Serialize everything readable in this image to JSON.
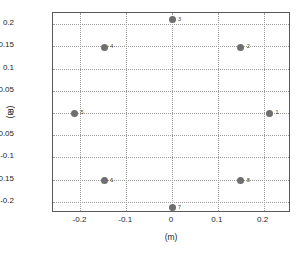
{
  "chart_data": {
    "type": "scatter",
    "title": "",
    "xlabel": "(m)",
    "ylabel": "(m)",
    "xlim": [
      -0.26,
      0.26
    ],
    "ylim": [
      -0.225,
      0.225
    ],
    "xticks": [
      "-0.2",
      "-0.1",
      "0",
      "0.1",
      "0.2"
    ],
    "xtick_values": [
      -0.2,
      -0.1,
      0,
      0.1,
      0.2
    ],
    "yticks": [
      "0.2",
      "0.15",
      "0.1",
      "0.05",
      "0",
      "-0.05",
      "-0.1",
      "-0.15",
      "-0.2"
    ],
    "ytick_values": [
      0.2,
      0.15,
      0.1,
      0.05,
      0,
      -0.05,
      -0.1,
      -0.15,
      -0.2
    ],
    "grid": true,
    "legend": "none",
    "marker_color": "#6e6e6e",
    "points": [
      {
        "label": "1",
        "x": 0.213,
        "y": 0.0
      },
      {
        "label": "2",
        "x": 0.15,
        "y": 0.148
      },
      {
        "label": "3",
        "x": 0.0,
        "y": 0.21
      },
      {
        "label": "4",
        "x": -0.148,
        "y": 0.148
      },
      {
        "label": "5",
        "x": -0.213,
        "y": 0.0
      },
      {
        "label": "6",
        "x": -0.148,
        "y": -0.152
      },
      {
        "label": "7",
        "x": 0.0,
        "y": -0.213
      },
      {
        "label": "8",
        "x": 0.15,
        "y": -0.152
      }
    ]
  }
}
